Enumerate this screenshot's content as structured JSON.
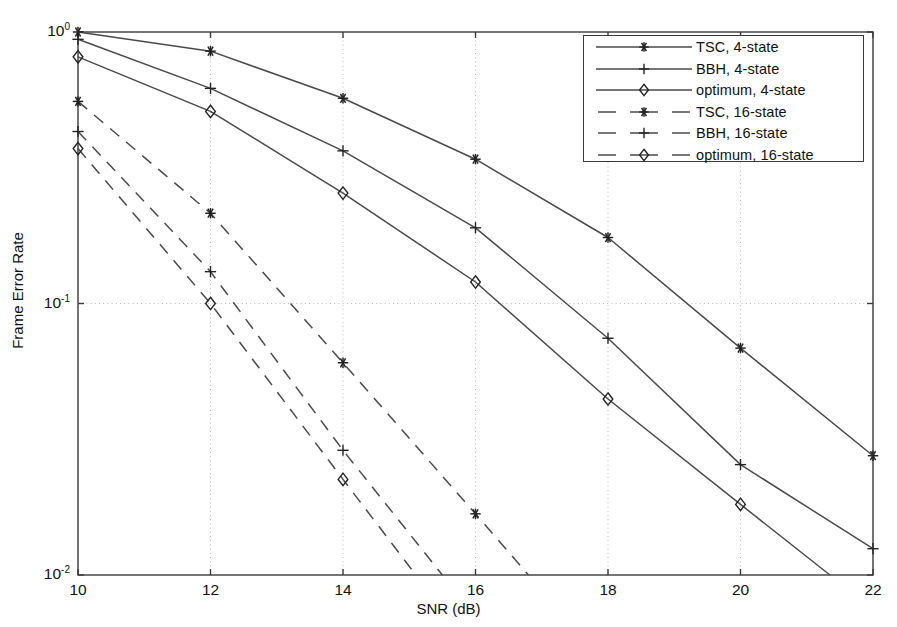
{
  "chart_data": {
    "type": "line",
    "title": "",
    "xlabel": "SNR (dB)",
    "ylabel": "Frame Error Rate",
    "xlim": [
      10,
      22
    ],
    "ylim": [
      0.01,
      1
    ],
    "yscale": "log",
    "xscale": "linear",
    "xticks": [
      10,
      12,
      14,
      16,
      18,
      20,
      22
    ],
    "xticklabels": [
      "10",
      "12",
      "14",
      "16",
      "18",
      "20",
      "22"
    ],
    "yticks": [
      0.01,
      0.1,
      1
    ],
    "yticklabels": [
      "10-2",
      "10-1",
      "100"
    ],
    "ytick_mantissa": [
      "10",
      "10",
      "10"
    ],
    "ytick_exponent": [
      "-2",
      "-1",
      "0"
    ],
    "grid": true,
    "grid_style": "dotted",
    "legend_position": "upper right",
    "series": [
      {
        "name": "TSC, 4-state",
        "style": "solid",
        "marker": "star",
        "x": [
          10,
          12,
          14,
          16,
          18,
          20,
          22
        ],
        "values": [
          1.0,
          0.85,
          0.57,
          0.34,
          0.175,
          0.0685,
          0.0275
        ]
      },
      {
        "name": "BBH, 4-state",
        "style": "solid",
        "marker": "plus",
        "x": [
          10,
          12,
          14,
          16,
          18,
          20,
          22
        ],
        "values": [
          0.94,
          0.62,
          0.365,
          0.19,
          0.0745,
          0.0255,
          0.0125
        ]
      },
      {
        "name": "optimum, 4-state",
        "style": "solid",
        "marker": "diamond",
        "x": [
          10,
          12,
          14,
          16,
          18,
          20,
          21.35
        ],
        "values": [
          0.81,
          0.51,
          0.255,
          0.12,
          0.0445,
          0.0182,
          0.01
        ]
      },
      {
        "name": "TSC, 16-state",
        "style": "dashed",
        "marker": "star",
        "x": [
          10,
          12,
          14,
          16,
          16.8
        ],
        "values": [
          0.555,
          0.215,
          0.0605,
          0.0168,
          0.01
        ]
      },
      {
        "name": "BBH, 16-state",
        "style": "dashed",
        "marker": "plus",
        "x": [
          10,
          12,
          14,
          15.5
        ],
        "values": [
          0.43,
          0.131,
          0.0288,
          0.01
        ]
      },
      {
        "name": "optimum, 16-state",
        "style": "dashed",
        "marker": "diamond",
        "x": [
          10,
          12,
          14,
          15.1
        ],
        "values": [
          0.372,
          0.1,
          0.0225,
          0.01
        ]
      }
    ]
  },
  "legend": {
    "entries": [
      {
        "label": "TSC, 4-state",
        "style": "solid",
        "marker": "star"
      },
      {
        "label": "BBH, 4-state",
        "style": "solid",
        "marker": "plus"
      },
      {
        "label": "optimum, 4-state",
        "style": "solid",
        "marker": "diamond"
      },
      {
        "label": "TSC, 16-state",
        "style": "dashed",
        "marker": "star"
      },
      {
        "label": "BBH, 16-state",
        "style": "dashed",
        "marker": "plus"
      },
      {
        "label": "optimum, 16-state",
        "style": "dashed",
        "marker": "diamond"
      }
    ]
  },
  "colors": {
    "line": "#4a4a4a",
    "axis": "#3a3a3a",
    "grid": "#b9b9b9",
    "marker": "#232323",
    "background": "#ffffff",
    "text": "#111111"
  }
}
